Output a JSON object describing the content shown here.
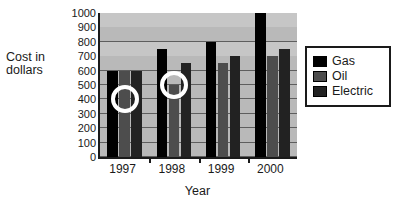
{
  "chart_data": {
    "type": "bar",
    "title": "",
    "xlabel": "Year",
    "ylabel": "Cost in dollars",
    "ylabel_lines": [
      "Cost in",
      "dollars"
    ],
    "categories": [
      "1997",
      "1998",
      "1999",
      "2000"
    ],
    "series": [
      {
        "name": "Gas",
        "color": "#000000",
        "values": [
          600,
          750,
          800,
          1000
        ]
      },
      {
        "name": "Oil",
        "color": "#4d4d4d",
        "values": [
          600,
          500,
          650,
          700
        ]
      },
      {
        "name": "Electric",
        "color": "#222222",
        "values": [
          600,
          650,
          700,
          750
        ]
      }
    ],
    "ylim": [
      0,
      1000
    ],
    "ytick_step": 100,
    "yticks": [
      "1000",
      "900",
      "800",
      "700",
      "600",
      "500",
      "400",
      "300",
      "200",
      "100",
      "0"
    ],
    "grid": true,
    "legend_position": "right",
    "plot_background": "#b9b9b9",
    "annotations": [
      {
        "name": "circle-1997-oil",
        "series": "Oil",
        "category": "1997",
        "value": 400
      },
      {
        "name": "circle-1998-oil",
        "series": "Oil",
        "category": "1998",
        "value": 500
      }
    ]
  },
  "legend": {
    "items": [
      {
        "label": "Gas"
      },
      {
        "label": "Oil"
      },
      {
        "label": "Electric"
      }
    ]
  }
}
